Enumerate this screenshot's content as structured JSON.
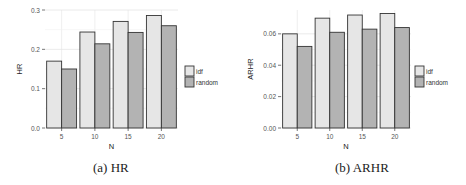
{
  "chart_data": [
    {
      "type": "bar",
      "title": "",
      "caption": "(a) HR",
      "xlabel": "N",
      "ylabel": "HR",
      "categories": [
        "5",
        "10",
        "15",
        "20"
      ],
      "series": [
        {
          "name": "idf",
          "values": [
            0.17,
            0.244,
            0.271,
            0.286
          ],
          "color": "#e6e6e6"
        },
        {
          "name": "random",
          "values": [
            0.15,
            0.214,
            0.243,
            0.26
          ],
          "color": "#b3b3b3"
        }
      ],
      "ylim": [
        0,
        0.3
      ],
      "yticks": [
        "0.0",
        "0.1",
        "0.2",
        "0.3"
      ],
      "grid": true,
      "legend_position": "right"
    },
    {
      "type": "bar",
      "title": "",
      "caption": "(b) ARHR",
      "xlabel": "N",
      "ylabel": "ARHR",
      "categories": [
        "5",
        "10",
        "15",
        "20"
      ],
      "series": [
        {
          "name": "idf",
          "values": [
            0.06,
            0.07,
            0.072,
            0.073
          ],
          "color": "#e6e6e6"
        },
        {
          "name": "random",
          "values": [
            0.052,
            0.061,
            0.063,
            0.064
          ],
          "color": "#b3b3b3"
        }
      ],
      "ylim": [
        0,
        0.075
      ],
      "yticks": [
        "0.00",
        "0.02",
        "0.04",
        "0.06"
      ],
      "grid": true,
      "legend_position": "right"
    }
  ]
}
